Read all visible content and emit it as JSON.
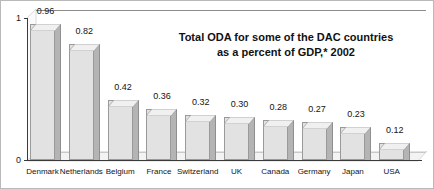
{
  "chart_data": {
    "type": "bar",
    "title": "Total ODA for some of the DAC countries as a percent of GDP,* 2002",
    "title_lines": [
      "Total ODA for some of the DAC countries",
      "as a percent of GDP,* 2002"
    ],
    "xlabel": "",
    "ylabel": "",
    "ylim": [
      0,
      1
    ],
    "ytick_labels": [
      "0",
      "1"
    ],
    "ytick_values": [
      0,
      1
    ],
    "grid": false,
    "legend": "none",
    "style": "pseudo-3d bars, gray fill",
    "categories": [
      "Denmark",
      "Netherlands",
      "Belgium",
      "France",
      "Switzerland",
      "UK",
      "Canada",
      "Germany",
      "Japan",
      "USA"
    ],
    "values": [
      0.96,
      0.82,
      0.42,
      0.36,
      0.32,
      0.3,
      0.28,
      0.27,
      0.23,
      0.12
    ],
    "value_labels": [
      "0.96",
      "0.82",
      "0.42",
      "0.36",
      "0.32",
      "0.30",
      "0.28",
      "0.27",
      "0.23",
      "0.12"
    ],
    "series": [
      {
        "name": "ODA as percent of GDP",
        "values": [
          0.96,
          0.82,
          0.42,
          0.36,
          0.32,
          0.3,
          0.28,
          0.27,
          0.23,
          0.12
        ]
      }
    ],
    "colors": {
      "bar_face": "#e2e2e2",
      "bar_side": "#b4b4b4",
      "bar_top": "#f0f0f0",
      "axis": "#3a3a3a",
      "text": "#141414",
      "background": "#ffffff"
    }
  }
}
